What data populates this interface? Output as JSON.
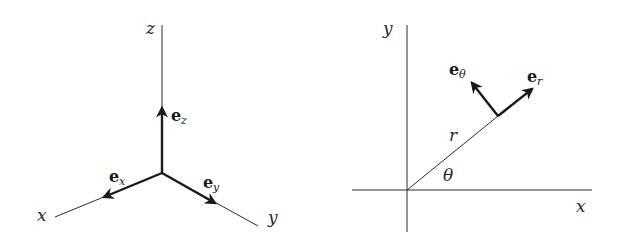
{
  "diagrams": {
    "cartesian": {
      "axes": {
        "x": "x",
        "y": "y",
        "z": "z"
      },
      "unit_vectors": {
        "ex": {
          "base": "e",
          "sub": "x"
        },
        "ey": {
          "base": "e",
          "sub": "y"
        },
        "ez": {
          "base": "e",
          "sub": "z"
        }
      }
    },
    "polar": {
      "axes": {
        "x": "x",
        "y": "y"
      },
      "radius_label": "r",
      "angle_label": "θ",
      "unit_vectors": {
        "er": {
          "base": "e",
          "sub": "r"
        },
        "etheta": {
          "base": "e",
          "sub": "θ"
        }
      }
    }
  },
  "colors": {
    "line": "#2a2a2a",
    "background": "#ffffff"
  }
}
